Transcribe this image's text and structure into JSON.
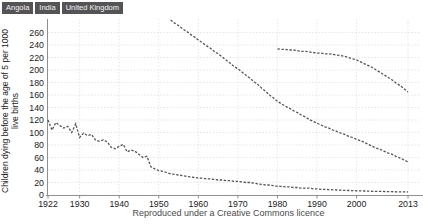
{
  "legend": {
    "items": [
      {
        "label": "Angola"
      },
      {
        "label": "India"
      },
      {
        "label": "United Kingdom"
      }
    ]
  },
  "caption": "Reproduced under a Creative Commons licence",
  "colors": {
    "series_line": "#555555",
    "grid": "#e3e0d9",
    "axis": "#8f8f8f",
    "tick_text": "#222222",
    "legend_bg": "#545456",
    "legend_text": "#f5f5f5",
    "caption_text": "#4a4a4a",
    "background": "#ffffff"
  },
  "chart_data": {
    "type": "line",
    "title": "",
    "xlabel": "",
    "ylabel": "Children dying before the age of 5 per 1000 live births",
    "ylabel_lines": [
      "Children dying before the age of 5 per 1000",
      "live births"
    ],
    "xlim": [
      1922,
      2013
    ],
    "ylim": [
      0,
      285
    ],
    "x_ticks": [
      1922,
      1930,
      1940,
      1950,
      1960,
      1970,
      1980,
      1990,
      2000,
      2013
    ],
    "y_ticks": [
      0,
      20,
      40,
      60,
      80,
      100,
      120,
      140,
      160,
      180,
      200,
      220,
      240,
      260
    ],
    "grid": true,
    "legend_position": "top-left",
    "line_style": "dashed",
    "series": [
      {
        "name": "Angola",
        "points": [
          [
            1980,
            234
          ],
          [
            1981,
            233
          ],
          [
            1982,
            233
          ],
          [
            1983,
            232
          ],
          [
            1984,
            232
          ],
          [
            1985,
            231
          ],
          [
            1986,
            230
          ],
          [
            1987,
            230
          ],
          [
            1988,
            229
          ],
          [
            1989,
            228
          ],
          [
            1990,
            227
          ],
          [
            1991,
            227
          ],
          [
            1992,
            226
          ],
          [
            1993,
            226
          ],
          [
            1994,
            225
          ],
          [
            1995,
            224
          ],
          [
            1996,
            223
          ],
          [
            1997,
            222
          ],
          [
            1998,
            220
          ],
          [
            1999,
            218
          ],
          [
            2000,
            216
          ],
          [
            2001,
            213
          ],
          [
            2002,
            210
          ],
          [
            2003,
            207
          ],
          [
            2004,
            204
          ],
          [
            2005,
            200
          ],
          [
            2006,
            196
          ],
          [
            2007,
            192
          ],
          [
            2008,
            188
          ],
          [
            2009,
            184
          ],
          [
            2010,
            179
          ],
          [
            2011,
            175
          ],
          [
            2012,
            170
          ],
          [
            2013,
            165
          ]
        ]
      },
      {
        "name": "India",
        "points": [
          [
            1953,
            280
          ],
          [
            1954,
            275
          ],
          [
            1955,
            271
          ],
          [
            1956,
            266
          ],
          [
            1957,
            262
          ],
          [
            1958,
            257
          ],
          [
            1959,
            253
          ],
          [
            1960,
            248
          ],
          [
            1961,
            244
          ],
          [
            1962,
            239
          ],
          [
            1963,
            235
          ],
          [
            1964,
            230
          ],
          [
            1965,
            226
          ],
          [
            1966,
            221
          ],
          [
            1967,
            216
          ],
          [
            1968,
            211
          ],
          [
            1969,
            206
          ],
          [
            1970,
            202
          ],
          [
            1971,
            197
          ],
          [
            1972,
            192
          ],
          [
            1973,
            187
          ],
          [
            1974,
            182
          ],
          [
            1975,
            177
          ],
          [
            1976,
            171
          ],
          [
            1977,
            166
          ],
          [
            1978,
            160
          ],
          [
            1979,
            155
          ],
          [
            1980,
            150
          ],
          [
            1981,
            146
          ],
          [
            1982,
            142
          ],
          [
            1983,
            139
          ],
          [
            1984,
            135
          ],
          [
            1985,
            132
          ],
          [
            1986,
            128
          ],
          [
            1987,
            125
          ],
          [
            1988,
            121
          ],
          [
            1989,
            118
          ],
          [
            1990,
            115
          ],
          [
            1991,
            112
          ],
          [
            1992,
            109
          ],
          [
            1993,
            107
          ],
          [
            1994,
            104
          ],
          [
            1995,
            102
          ],
          [
            1996,
            99
          ],
          [
            1997,
            97
          ],
          [
            1998,
            94
          ],
          [
            1999,
            92
          ],
          [
            2000,
            89
          ],
          [
            2001,
            87
          ],
          [
            2002,
            84
          ],
          [
            2003,
            81
          ],
          [
            2004,
            78
          ],
          [
            2005,
            75
          ],
          [
            2006,
            73
          ],
          [
            2007,
            70
          ],
          [
            2008,
            67
          ],
          [
            2009,
            65
          ],
          [
            2010,
            62
          ],
          [
            2011,
            59
          ],
          [
            2012,
            56
          ],
          [
            2013,
            53
          ]
        ]
      },
      {
        "name": "United Kingdom",
        "points": [
          [
            1922,
            120
          ],
          [
            1923,
            104
          ],
          [
            1924,
            116
          ],
          [
            1925,
            111
          ],
          [
            1926,
            107
          ],
          [
            1927,
            110
          ],
          [
            1928,
            100
          ],
          [
            1929,
            114
          ],
          [
            1930,
            92
          ],
          [
            1931,
            99
          ],
          [
            1932,
            95
          ],
          [
            1933,
            97
          ],
          [
            1934,
            88
          ],
          [
            1935,
            86
          ],
          [
            1936,
            88
          ],
          [
            1937,
            85
          ],
          [
            1938,
            76
          ],
          [
            1939,
            74
          ],
          [
            1940,
            78
          ],
          [
            1941,
            81
          ],
          [
            1942,
            69
          ],
          [
            1943,
            72
          ],
          [
            1944,
            70
          ],
          [
            1945,
            65
          ],
          [
            1946,
            60
          ],
          [
            1947,
            62
          ],
          [
            1948,
            45
          ],
          [
            1949,
            42
          ],
          [
            1950,
            39
          ],
          [
            1951,
            38
          ],
          [
            1952,
            36
          ],
          [
            1953,
            34
          ],
          [
            1954,
            33
          ],
          [
            1955,
            32
          ],
          [
            1956,
            31
          ],
          [
            1957,
            30
          ],
          [
            1958,
            29
          ],
          [
            1959,
            28
          ],
          [
            1960,
            27
          ],
          [
            1961,
            27
          ],
          [
            1962,
            26
          ],
          [
            1963,
            26
          ],
          [
            1964,
            25
          ],
          [
            1965,
            24
          ],
          [
            1966,
            24
          ],
          [
            1967,
            23
          ],
          [
            1968,
            23
          ],
          [
            1969,
            22
          ],
          [
            1970,
            22
          ],
          [
            1971,
            21
          ],
          [
            1972,
            20
          ],
          [
            1973,
            20
          ],
          [
            1974,
            19
          ],
          [
            1975,
            18
          ],
          [
            1976,
            17
          ],
          [
            1977,
            16
          ],
          [
            1978,
            16
          ],
          [
            1979,
            15
          ],
          [
            1980,
            14
          ],
          [
            1981,
            14
          ],
          [
            1982,
            13
          ],
          [
            1983,
            13
          ],
          [
            1984,
            12
          ],
          [
            1985,
            12
          ],
          [
            1986,
            11
          ],
          [
            1987,
            11
          ],
          [
            1988,
            11
          ],
          [
            1989,
            10
          ],
          [
            1990,
            10
          ],
          [
            1991,
            9
          ],
          [
            1992,
            9
          ],
          [
            1993,
            8.6
          ],
          [
            1994,
            8.3
          ],
          [
            1995,
            8
          ],
          [
            1996,
            7.7
          ],
          [
            1997,
            7.4
          ],
          [
            1998,
            7.2
          ],
          [
            1999,
            7
          ],
          [
            2000,
            6.8
          ],
          [
            2001,
            6.6
          ],
          [
            2002,
            6.4
          ],
          [
            2003,
            6.2
          ],
          [
            2004,
            6
          ],
          [
            2005,
            5.9
          ],
          [
            2006,
            5.7
          ],
          [
            2007,
            5.6
          ],
          [
            2008,
            5.4
          ],
          [
            2009,
            5.3
          ],
          [
            2010,
            5.1
          ],
          [
            2011,
            5
          ],
          [
            2012,
            4.9
          ],
          [
            2013,
            4.8
          ]
        ]
      }
    ]
  }
}
